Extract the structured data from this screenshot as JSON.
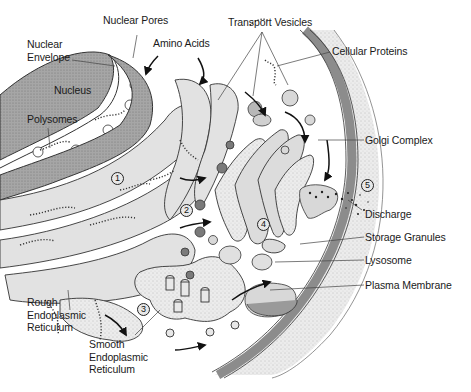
{
  "diagram": {
    "labels": {
      "nuclear_pores": "Nuclear Pores",
      "transport_vesicles": "Transport Vesicles",
      "nuclear_envelope": "Nuclear\nEnvelope",
      "amino_acids": "Amino Acids",
      "cellular_proteins": "Cellular Proteins",
      "nucleus": "Nucleus",
      "polysomes": "Polysomes",
      "golgi_complex": "Golgi Complex",
      "discharge": "Discharge",
      "storage_granules": "Storage Granules",
      "lysosome": "Lysosome",
      "plasma_membrane": "Plasma Membrane",
      "rough_er": "Rough\nEndoplasmic\nReticulum",
      "smooth_er": "Smooth\nEndoplasmic\nReticulum"
    },
    "steps": [
      "1",
      "2",
      "3",
      "4",
      "5"
    ],
    "colors": {
      "membrane": "#8c8c8c",
      "cytoplasm_fill": "#e6e6e6",
      "nucleus_fill": "#a8a8a8",
      "vesicle_dark": "#7a7a7a",
      "outline": "#333333"
    }
  }
}
